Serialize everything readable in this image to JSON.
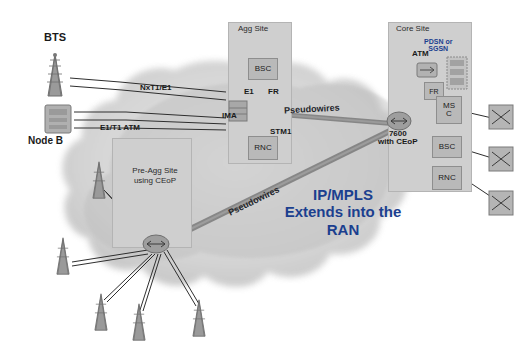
{
  "diagram": {
    "title_overlay": "IP/MPLS\nExtends into the\nRAN",
    "sites": [
      {
        "id": "agg",
        "label": "Agg Site"
      },
      {
        "id": "core",
        "label": "Core Site"
      },
      {
        "id": "preagg",
        "label": "Pre-Agg Site\nusing CEoP"
      }
    ],
    "nodes": [
      {
        "id": "bts",
        "label": "BTS"
      },
      {
        "id": "nodeb",
        "label": "Node B"
      },
      {
        "id": "bsc_agg",
        "label": "BSC"
      },
      {
        "id": "rnc_agg",
        "label": "RNC"
      },
      {
        "id": "fr_core",
        "label": "FR"
      },
      {
        "id": "msc_core",
        "label": "MS\nC"
      },
      {
        "id": "bsc_core",
        "label": "BSC"
      },
      {
        "id": "rnc_core",
        "label": "RNC"
      },
      {
        "id": "atm_core",
        "label": "ATM"
      },
      {
        "id": "pdsn_sgsn",
        "label": "PDSN  or\nSGSN"
      }
    ],
    "link_labels": [
      {
        "id": "nxt1e1",
        "text": "NxT1/E1"
      },
      {
        "id": "e1t1atm",
        "text": "E1/T1 ATM"
      },
      {
        "id": "ima",
        "text": "IMA"
      },
      {
        "id": "e1",
        "text": "E1"
      },
      {
        "id": "fr",
        "text": "FR"
      },
      {
        "id": "stm1",
        "text": "STM1"
      },
      {
        "id": "pw_top",
        "text": "Pseudowires"
      },
      {
        "id": "pw_bottom",
        "text": "Pseudowires"
      },
      {
        "id": "router",
        "text": "7600\nwith CEoP"
      }
    ],
    "colors": {
      "cloud": "#d6d6d6",
      "site_box": "#cfcfcf",
      "node_box": "#b9b9b9",
      "accent_text": "#1b3f8f",
      "link": "#3f3f3f",
      "pseudowire": "#6f6f6f"
    }
  }
}
